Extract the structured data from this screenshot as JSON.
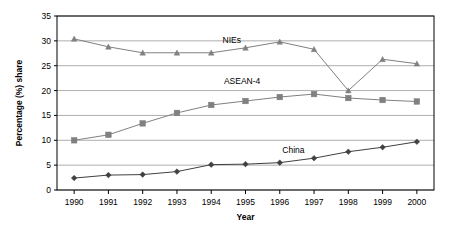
{
  "chart_data": {
    "type": "line",
    "title": "",
    "xlabel": "Year",
    "ylabel": "Percentage (%) share",
    "categories": [
      "1990",
      "1991",
      "1992",
      "1993",
      "1994",
      "1995",
      "1996",
      "1997",
      "1998",
      "1999",
      "2000"
    ],
    "x": [
      1990,
      1991,
      1992,
      1993,
      1994,
      1995,
      1996,
      1997,
      1998,
      1999,
      2000
    ],
    "xlim": [
      1989.5,
      2000.5
    ],
    "ylim": [
      0,
      35
    ],
    "ytick_labels": [
      "0",
      "5",
      "10",
      "15",
      "20",
      "25",
      "30",
      "35"
    ],
    "yticks": [
      0,
      5,
      10,
      15,
      20,
      25,
      30,
      35
    ],
    "grid": "horizontal",
    "legend": "inline-labels",
    "series": [
      {
        "name": "NIEs",
        "marker": "triangle",
        "color": "#808080",
        "label_x": 1994.6,
        "label_y": 29.6,
        "values": [
          30.4,
          28.8,
          27.6,
          27.6,
          27.6,
          28.6,
          29.8,
          28.3,
          20.0,
          26.3,
          25.4
        ]
      },
      {
        "name": "ASEAN-4",
        "marker": "square",
        "color": "#808080",
        "label_x": 1994.9,
        "label_y": 21.4,
        "values": [
          10.0,
          11.1,
          13.4,
          15.5,
          17.1,
          17.9,
          18.7,
          19.3,
          18.5,
          18.1,
          17.8
        ]
      },
      {
        "name": "China",
        "marker": "diamond",
        "color": "#404040",
        "label_x": 1996.4,
        "label_y": 7.4,
        "values": [
          2.4,
          3.0,
          3.1,
          3.7,
          5.1,
          5.2,
          5.5,
          6.4,
          7.7,
          8.6,
          9.7
        ]
      }
    ],
    "colors": {
      "axis": "#000000",
      "grid": "#999999",
      "plot_background": "#ffffff",
      "nies": "#808080",
      "asean4": "#808080",
      "china": "#404040"
    }
  }
}
